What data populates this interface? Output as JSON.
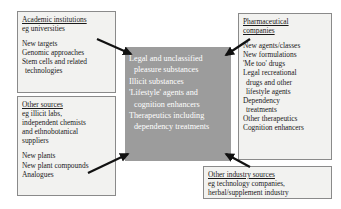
{
  "diagram": {
    "center": {
      "lines": [
        "Legal and unclassified",
        "pleasure substances",
        "Illicit substances",
        "'Lifestyle' agents and",
        "cognition enhancers",
        "Therapeutics including",
        "dependency treatments"
      ],
      "background_color": "#9c9c9c",
      "text_color": "#ffffff"
    },
    "boxes": {
      "academic": {
        "header": "Academic institutions",
        "subtitle": "eg universities",
        "items": [
          "New targets",
          "Genomic approaches",
          "Stem cells and related",
          "technologies"
        ]
      },
      "other_sources": {
        "header": "Other sources",
        "subtitle_lines": [
          "eg illicit labs,",
          "independent chemists",
          "and ethnobotanical",
          "suppliers"
        ],
        "items": [
          "New plants",
          "New plant compounds",
          "Analogues"
        ]
      },
      "pharmaceutical": {
        "header_lines": [
          "Pharmaceutical",
          "companies"
        ],
        "items": [
          "New agents/classes",
          "New formulations",
          "'Me too' drugs",
          "Legal recreational",
          "drugs and other",
          "lifestyle agents",
          "Dependency",
          "treatments",
          "Other therapeutics",
          "Cognition enhancers"
        ]
      },
      "other_industry": {
        "header": "Other industry sources",
        "lines": [
          "eg technology companies,",
          "herbal/supplement industry"
        ]
      }
    },
    "arrows": [
      {
        "name": "academic-to-center"
      },
      {
        "name": "other-sources-to-center"
      },
      {
        "name": "pharmaceutical-to-center"
      },
      {
        "name": "other-industry-to-center"
      }
    ],
    "colors": {
      "box_fill": "#f2f2f0",
      "box_border": "#8a8a8a",
      "arrow": "#111111"
    }
  }
}
